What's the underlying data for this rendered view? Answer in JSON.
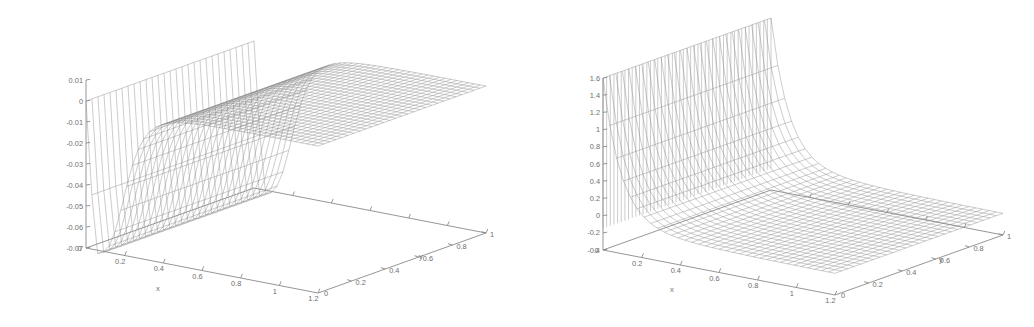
{
  "figure": {
    "background": "#ffffff",
    "line_color": "#8a8a8a",
    "mesh_color": "#8e8e8e",
    "panel_count": 2
  },
  "chart_data": [
    {
      "type": "surface",
      "title": "",
      "subtitle": "",
      "panel": "left",
      "style": "wireframe-mesh",
      "projection": "3d-isometric",
      "grid": false,
      "legend": null,
      "xlabel": "x",
      "ylabel": "y",
      "zlabel": "",
      "xticks": [
        "0",
        "0.2",
        "0.4",
        "0.6",
        "0.8",
        "1",
        "1.2"
      ],
      "xtick_values": [
        0,
        0.2,
        0.4,
        0.6,
        0.8,
        1,
        1.2
      ],
      "yticks": [
        "0",
        "0.2",
        "0.4",
        "0.6",
        "0.8",
        "1"
      ],
      "ytick_values": [
        0,
        0.2,
        0.4,
        0.6,
        0.8,
        1
      ],
      "zticks": [
        "0.01",
        "0",
        "-0.01",
        "-0.02",
        "-0.03",
        "-0.04",
        "-0.05",
        "-0.06",
        "-0.07"
      ],
      "ztick_values": [
        0.01,
        0,
        -0.01,
        -0.02,
        -0.03,
        -0.04,
        -0.05,
        -0.06,
        -0.07
      ],
      "xlim": [
        0,
        1.2
      ],
      "ylim": [
        0,
        1
      ],
      "zlim": [
        -0.07,
        0.01
      ],
      "origin_label": "0",
      "description": "Mesh surface flat near zero over most of the domain with a smooth negative dip near the x=0 boundary reaching about -0.07",
      "surface": {
        "nx": 40,
        "ny": 28,
        "model": "boundary-layer-dip",
        "plateau_z": 0.0,
        "min_z": -0.072,
        "dip_scale_x": 0.17,
        "dip_depth": 0.072
      }
    },
    {
      "type": "surface",
      "title": "",
      "subtitle": "",
      "panel": "right",
      "style": "wireframe-mesh",
      "projection": "3d-isometric",
      "grid": false,
      "legend": null,
      "xlabel": "x",
      "ylabel": "y",
      "zlabel": "",
      "xticks": [
        "0",
        "0.2",
        "0.4",
        "0.6",
        "0.8",
        "1",
        "1.2"
      ],
      "xtick_values": [
        0,
        0.2,
        0.4,
        0.6,
        0.8,
        1,
        1.2
      ],
      "yticks": [
        "0",
        "0.2",
        "0.4",
        "0.6",
        "0.8",
        "1"
      ],
      "ytick_values": [
        0,
        0.2,
        0.4,
        0.6,
        0.8,
        1
      ],
      "zticks": [
        "1.6",
        "1.4",
        "1.2",
        "1",
        "0.8",
        "0.6",
        "0.4",
        "0.2",
        "0",
        "-0.2",
        "-0.4"
      ],
      "ztick_values": [
        1.6,
        1.4,
        1.2,
        1,
        0.8,
        0.6,
        0.4,
        0.2,
        0,
        -0.2,
        -0.4
      ],
      "xlim": [
        0,
        1.2
      ],
      "ylim": [
        0,
        1
      ],
      "zlim": [
        -0.4,
        1.6
      ],
      "origin_label": "0",
      "description": "Mesh surface with a steep positive spike near x=0 decaying rapidly, settling near zero to slightly negative across the rest of the domain",
      "surface": {
        "nx": 34,
        "ny": 26,
        "model": "boundary-layer-spike",
        "peak_z": 1.6,
        "tail_z": -0.15,
        "spike_scale_x": 0.09
      }
    }
  ],
  "panels": [
    {
      "name": "left-surface-plot",
      "axis_labels": {
        "x": "x",
        "y": "y"
      },
      "origin": "0",
      "z_tick_labels": [
        "0.01",
        "0",
        "-0.01",
        "-0.02",
        "-0.03",
        "-0.04",
        "-0.05",
        "-0.06",
        "-0.07"
      ],
      "x_tick_labels": [
        "0.2",
        "0.4",
        "0.6",
        "0.8",
        "1",
        "1.2"
      ],
      "y_tick_labels": [
        "0",
        "0.2",
        "0.4",
        "0.6",
        "0.8",
        "1"
      ]
    },
    {
      "name": "right-surface-plot",
      "axis_labels": {
        "x": "x",
        "y": "y"
      },
      "origin": "0",
      "z_tick_labels": [
        "1.6",
        "1.4",
        "1.2",
        "1",
        "0.8",
        "0.6",
        "0.4",
        "0.2",
        "0",
        "-0.2",
        "-0.4"
      ],
      "x_tick_labels": [
        "0.2",
        "0.4",
        "0.6",
        "0.8",
        "1",
        "1.2"
      ],
      "y_tick_labels": [
        "0",
        "0.2",
        "0.4",
        "0.6",
        "0.8",
        "1"
      ]
    }
  ]
}
